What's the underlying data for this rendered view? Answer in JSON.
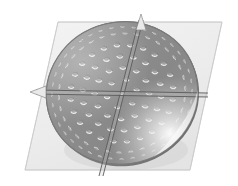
{
  "scene": {
    "title": "Perforated disc with two section planes",
    "type": "cad-3d-render",
    "background_color": "#ffffff"
  },
  "ground_plane": {
    "name": "reference-plane",
    "fill_color": "#eeeeee",
    "stroke_color": "#b9b9b9",
    "opacity": 0.85,
    "corners": [
      [
        58,
        22
      ],
      [
        222,
        22
      ],
      [
        190,
        170
      ],
      [
        25,
        170
      ]
    ]
  },
  "disc": {
    "name": "perforated-disc",
    "shape": "ellipse",
    "center": [
      122,
      93
    ],
    "radius_x": 76,
    "radius_y": 71,
    "rotation_deg": -14,
    "body_color": "#8e8e8e",
    "edge_color": "#6e6e6e",
    "highlight_color": "#f2f2f2",
    "shadow_color": "#6f6f6f"
  },
  "section_planes": [
    {
      "name": "vertical-section-plane",
      "line_color": "#5a5a5a",
      "points": [
        [
          139,
          20
        ],
        [
          99,
          176
        ]
      ],
      "band_offset": 4,
      "marker": "arrow-top"
    },
    {
      "name": "horizontal-section-plane",
      "line_color": "#5a5a5a",
      "points": [
        [
          36,
          93
        ],
        [
          208,
          96
        ]
      ],
      "band_offset": 3,
      "marker": "arrow-left"
    }
  ],
  "perforations": {
    "name": "hole-pattern",
    "hole_fill": "#9e9e9e",
    "hole_rim_light": "#e6e6e6",
    "hole_rim_dark": "#6a6a6a",
    "rings": [
      {
        "radius_frac": 0.2,
        "count": 6,
        "hole_type": "round",
        "size": 3.0
      },
      {
        "radius_frac": 0.36,
        "count": 12,
        "hole_type": "round",
        "size": 3.2
      },
      {
        "radius_frac": 0.52,
        "count": 18,
        "hole_type": "round",
        "size": 3.2
      },
      {
        "radius_frac": 0.68,
        "count": 24,
        "hole_type": "round",
        "size": 3.0
      },
      {
        "radius_frac": 0.84,
        "count": 34,
        "hole_type": "slot",
        "size": 2.4
      },
      {
        "radius_frac": 0.93,
        "count": 40,
        "hole_type": "slot",
        "size": 2.0
      }
    ],
    "center_hole": {
      "present": true,
      "size": 2.4
    }
  },
  "labels": {
    "figure_caption": "",
    "dimension_text": "",
    "annotation": ""
  }
}
